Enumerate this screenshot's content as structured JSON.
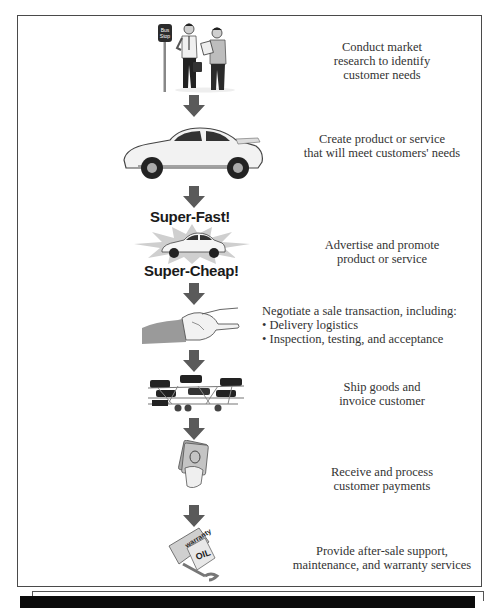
{
  "diagram": {
    "steps": [
      {
        "id": "market-research",
        "icon": "bus-stop-people-icon",
        "lines": [
          "Conduct market",
          "research to identify",
          "customer needs"
        ]
      },
      {
        "id": "create-product",
        "icon": "sports-car-icon",
        "lines": [
          "Create product or service",
          "that will meet customers' needs"
        ]
      },
      {
        "id": "advertise",
        "icon": "advertising-burst-car-icon",
        "burst_top": "Super-Fast!",
        "burst_bottom": "Super-Cheap!",
        "lines": [
          "Advertise and promote",
          "product or service"
        ]
      },
      {
        "id": "negotiate",
        "icon": "handshake-icon",
        "lines": [
          "Negotiate a sale transaction, including:"
        ],
        "bullets": [
          "• Delivery logistics",
          "• Inspection, testing, and acceptance"
        ]
      },
      {
        "id": "ship",
        "icon": "car-carrier-truck-icon",
        "lines": [
          "Ship goods and",
          "invoice customer"
        ]
      },
      {
        "id": "payments",
        "icon": "cash-in-hand-icon",
        "lines": [
          "Receive and process",
          "customer payments"
        ]
      },
      {
        "id": "after-sale",
        "icon": "warranty-oil-wrench-icon",
        "warranty_label": "warranty",
        "oil_label": "OIL",
        "lines": [
          "Provide after-sale support,",
          "maintenance, and warranty services"
        ]
      }
    ],
    "bus_stop_sign": [
      "Bus",
      "Stop"
    ],
    "colors": {
      "frame": "#4a4a4a",
      "arrow": "#5a5a5a",
      "text": "#333333",
      "bottom_bar": "#0b0b0b"
    }
  }
}
